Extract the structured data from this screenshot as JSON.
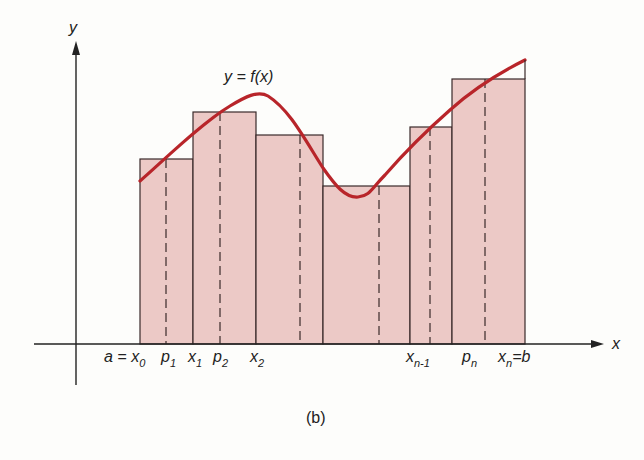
{
  "figure": {
    "caption": "(b)",
    "curve_label": "y = f(x)",
    "axis_x_label": "x",
    "axis_y_label": "y",
    "colors": {
      "fill": "#ecc9c6",
      "curve": "#b8252a",
      "line": "#3a2a2a"
    }
  },
  "tick_labels": [
    {
      "main": "a = x",
      "sub": "0"
    },
    {
      "main": "p",
      "sub": "1"
    },
    {
      "main": "x",
      "sub": "1"
    },
    {
      "main": "p",
      "sub": "2"
    },
    {
      "main": "x",
      "sub": "2"
    },
    {
      "main": "x",
      "sub": "n-1"
    },
    {
      "main": "p",
      "sub": "n"
    },
    {
      "main": "x",
      "sub": "n",
      "suffix": "=b"
    }
  ],
  "rectangles": [
    {
      "x0": 140,
      "x1": 193,
      "top": 159,
      "p": 166
    },
    {
      "x0": 193,
      "x1": 256,
      "top": 112,
      "p": 220
    },
    {
      "x0": 256,
      "x1": 323,
      "top": 135,
      "p": 300
    },
    {
      "x0": 323,
      "x1": 410,
      "top": 186,
      "p": 379
    },
    {
      "x0": 410,
      "x1": 452,
      "top": 127,
      "p": 430
    },
    {
      "x0": 452,
      "x1": 525,
      "top": 79,
      "p": 485
    }
  ]
}
